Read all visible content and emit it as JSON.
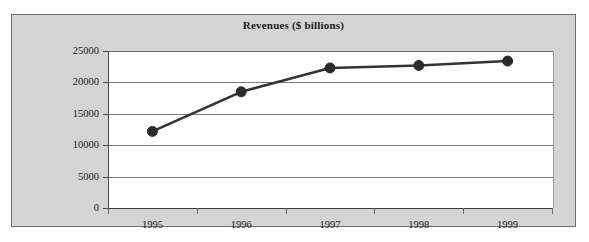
{
  "chart_data": {
    "type": "line",
    "title": "Revenues ($ billions)",
    "xlabel": "",
    "ylabel": "",
    "categories": [
      "1995",
      "1996",
      "1997",
      "1998",
      "1999"
    ],
    "series": [
      {
        "name": "Revenues",
        "values": [
          12200,
          18500,
          22300,
          22700,
          23400
        ],
        "line_color": "#333333",
        "marker_color": "#2b2b2b",
        "marker": "circle"
      }
    ],
    "ylim": [
      0,
      25000
    ],
    "yticks": [
      0,
      5000,
      10000,
      15000,
      20000,
      25000
    ],
    "ytick_labels": [
      "0",
      "5000",
      "10000",
      "15000",
      "20000",
      "25000"
    ],
    "xtick_labels": [
      "1995",
      "1996",
      "1997",
      "1998",
      "1999"
    ],
    "grid": true,
    "grid_axis": "y",
    "legend": false,
    "legend_position": "none"
  },
  "figure": {
    "panel_background": "#d4d4d4",
    "plot_background": "#ffffff",
    "border_color": "#6e6e6e",
    "gridline_color": "#7a7a7a",
    "text_color": "#1b1b1b"
  }
}
